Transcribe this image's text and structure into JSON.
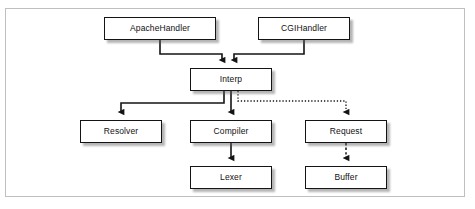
{
  "figure": {
    "type": "flowchart",
    "frame": {
      "border_color": "#bfbfbf",
      "background": "#ffffff"
    }
  },
  "nodes": [
    {
      "id": "apachehandler",
      "label": "ApacheHandler",
      "x": 104,
      "y": 17,
      "w": 112,
      "h": 23
    },
    {
      "id": "cgihandler",
      "label": "CGIHandler",
      "x": 258,
      "y": 17,
      "w": 92,
      "h": 23
    },
    {
      "id": "interp",
      "label": "Interp",
      "x": 190,
      "y": 68,
      "w": 82,
      "h": 23
    },
    {
      "id": "resolver",
      "label": "Resolver",
      "x": 80,
      "y": 120,
      "w": 82,
      "h": 23
    },
    {
      "id": "compiler",
      "label": "Compiler",
      "x": 190,
      "y": 120,
      "w": 82,
      "h": 23
    },
    {
      "id": "request",
      "label": "Request",
      "x": 305,
      "y": 120,
      "w": 82,
      "h": 23
    },
    {
      "id": "lexer",
      "label": "Lexer",
      "x": 190,
      "y": 166,
      "w": 82,
      "h": 23
    },
    {
      "id": "buffer",
      "label": "Buffer",
      "x": 305,
      "y": 166,
      "w": 82,
      "h": 23
    }
  ],
  "edges": [
    {
      "id": "apachehandler-interp",
      "from": "ApacheHandler",
      "to": "Interp",
      "style": "solid"
    },
    {
      "id": "cgihandler-interp",
      "from": "CGIHandler",
      "to": "Interp",
      "style": "solid"
    },
    {
      "id": "interp-resolver",
      "from": "Interp",
      "to": "Resolver",
      "style": "solid"
    },
    {
      "id": "interp-compiler",
      "from": "Interp",
      "to": "Compiler",
      "style": "solid"
    },
    {
      "id": "interp-request",
      "from": "Interp",
      "to": "Request",
      "style": "dotted"
    },
    {
      "id": "compiler-lexer",
      "from": "Compiler",
      "to": "Lexer",
      "style": "solid"
    },
    {
      "id": "request-buffer",
      "from": "Request",
      "to": "Buffer",
      "style": "dashed"
    }
  ],
  "colors": {
    "box_border": "#141414",
    "box_fill": "#ffffff",
    "line": "#141414",
    "shadow": "#5a5a5a",
    "frame_border": "#bfbfbf",
    "text": "#111111"
  }
}
